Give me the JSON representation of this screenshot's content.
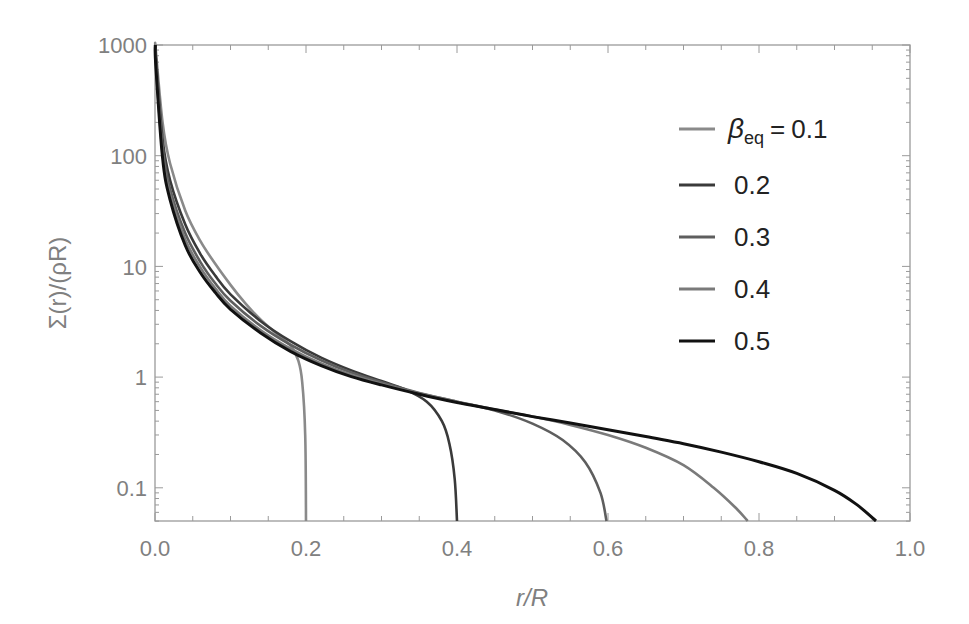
{
  "chart_data": {
    "type": "line",
    "title": "",
    "xlabel": "r/R",
    "ylabel": "Σ(r)/(ρR)",
    "xlim": [
      0.0,
      1.0
    ],
    "ylim": [
      0.05,
      1000
    ],
    "yscale": "log",
    "grid": false,
    "legend_position": "upper right (inside)",
    "legend_title_prefix": "β_eq =",
    "x_ticks": [
      "0.0",
      "0.2",
      "0.4",
      "0.6",
      "0.8",
      "1.0"
    ],
    "y_ticks": [
      "0.1",
      "1",
      "10",
      "100",
      "1000"
    ],
    "series": [
      {
        "name": "β_eq = 0.1",
        "label": "0.1",
        "color": "#8a8a8a",
        "x": [
          0.001,
          0.01,
          0.02,
          0.04,
          0.06,
          0.08,
          0.1,
          0.12,
          0.14,
          0.16,
          0.18,
          0.19,
          0.195,
          0.199,
          0.2
        ],
        "y": [
          900,
          200,
          85,
          32,
          17,
          10.5,
          6.8,
          4.6,
          3.3,
          2.5,
          1.9,
          1.4,
          0.9,
          0.3,
          0.05
        ]
      },
      {
        "name": "β_eq = 0.2",
        "label": "0.2",
        "color": "#3a3a3a",
        "x": [
          0.001,
          0.01,
          0.02,
          0.04,
          0.06,
          0.08,
          0.1,
          0.14,
          0.18,
          0.22,
          0.26,
          0.3,
          0.33,
          0.36,
          0.38,
          0.39,
          0.397,
          0.4
        ],
        "y": [
          800,
          140,
          60,
          24,
          13,
          8.2,
          5.6,
          3.2,
          2.1,
          1.5,
          1.15,
          0.92,
          0.78,
          0.6,
          0.4,
          0.25,
          0.12,
          0.05
        ]
      },
      {
        "name": "β_eq = 0.3",
        "label": "0.3",
        "color": "#5e5e5e",
        "x": [
          0.001,
          0.01,
          0.02,
          0.04,
          0.06,
          0.08,
          0.1,
          0.14,
          0.18,
          0.22,
          0.26,
          0.3,
          0.35,
          0.4,
          0.45,
          0.5,
          0.54,
          0.57,
          0.59,
          0.598
        ],
        "y": [
          750,
          120,
          50,
          20,
          11,
          7.0,
          4.9,
          2.9,
          1.95,
          1.42,
          1.1,
          0.9,
          0.72,
          0.6,
          0.5,
          0.38,
          0.27,
          0.17,
          0.09,
          0.05
        ]
      },
      {
        "name": "β_eq = 0.4",
        "label": "0.4",
        "color": "#7a7a7a",
        "x": [
          0.001,
          0.01,
          0.02,
          0.04,
          0.06,
          0.08,
          0.1,
          0.14,
          0.18,
          0.22,
          0.26,
          0.3,
          0.35,
          0.4,
          0.45,
          0.5,
          0.55,
          0.6,
          0.65,
          0.7,
          0.74,
          0.77,
          0.785
        ],
        "y": [
          700,
          105,
          44,
          17.5,
          9.8,
          6.3,
          4.4,
          2.65,
          1.8,
          1.33,
          1.05,
          0.87,
          0.71,
          0.6,
          0.51,
          0.44,
          0.37,
          0.3,
          0.23,
          0.16,
          0.1,
          0.065,
          0.05
        ]
      },
      {
        "name": "β_eq = 0.5",
        "label": "0.5",
        "color": "#111111",
        "x": [
          0.001,
          0.01,
          0.02,
          0.04,
          0.06,
          0.08,
          0.1,
          0.14,
          0.18,
          0.22,
          0.26,
          0.3,
          0.35,
          0.4,
          0.45,
          0.5,
          0.55,
          0.6,
          0.65,
          0.7,
          0.75,
          0.8,
          0.85,
          0.9,
          0.93,
          0.955
        ],
        "y": [
          650,
          95,
          40,
          15.5,
          8.8,
          5.8,
          4.1,
          2.5,
          1.7,
          1.27,
          1.01,
          0.85,
          0.7,
          0.59,
          0.51,
          0.44,
          0.385,
          0.335,
          0.29,
          0.25,
          0.21,
          0.172,
          0.135,
          0.095,
          0.07,
          0.05
        ]
      }
    ]
  },
  "legend": {
    "items": [
      {
        "prefix_symbol": "β",
        "prefix_subscript": "eq",
        "prefix_equals": "=",
        "value": "0.1",
        "color": "#8a8a8a"
      },
      {
        "value": "0.2",
        "color": "#3a3a3a"
      },
      {
        "value": "0.3",
        "color": "#5e5e5e"
      },
      {
        "value": "0.4",
        "color": "#7a7a7a"
      },
      {
        "value": "0.5",
        "color": "#111111"
      }
    ]
  },
  "axes": {
    "xlabel": "r/R",
    "ylabel": "Σ(r)/(ρR)",
    "x_tick_labels": [
      "0.0",
      "0.2",
      "0.4",
      "0.6",
      "0.8",
      "1.0"
    ],
    "y_tick_labels": [
      "1000",
      "100",
      "10",
      "1",
      "0.1"
    ]
  }
}
